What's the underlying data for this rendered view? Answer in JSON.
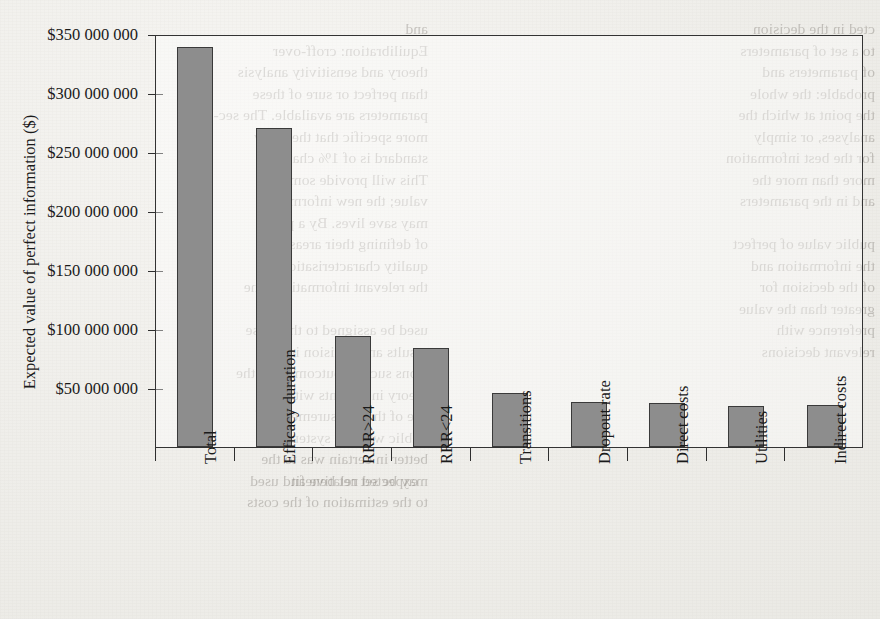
{
  "page": {
    "background_color": "#f1f0ec",
    "bleed_text_left": "and\nEquilibration: croff-over\ntheory and sensitivity analysis\nthan perfect or sure of these\nparameters are available. The sec-\nmore specific that the study\nstandard is of 1% chance.\nThis will provide some\nvalue; the new information\nmay save lives. By a point\nof defining their areas of\nquality characterisation\nthe relevant information. The\n\nused be assigned to the those\nresults and decision in the\nsions such as outcomes for the\ntheory in patients with\nuse of the measurements of\npublic who are systematic\nbetter in certain was to the\nmay be set relative and used\nto the estimation of the costs",
    "bleed_text_right": "cted in the decision\nto a set of parameters\nof parameters and\nprobable: the whole\nthe point at which the\nanalyses, or simply\nfor the best information\nmore than more the\nand in the parameters\n\npublic value of perfect\nthe information and\nof the decision for\ngreater than the value\npreference with\nrelevant decisions",
    "bleed_text_bottom": "expected net benefit"
  },
  "chart_data": {
    "type": "bar",
    "title": "",
    "xlabel": "",
    "ylabel": "Expected value of perfect information ($)",
    "categories": [
      "Total",
      "Efficacy duration",
      "RRR>24",
      "RRR<24",
      "Transitions",
      "Dropout rate",
      "Direct costs",
      "Utilities",
      "Indirect costs"
    ],
    "values": [
      339000000,
      270000000,
      94000000,
      84000000,
      46000000,
      38000000,
      37000000,
      35000000,
      36000000
    ],
    "ylim": [
      0,
      350000000
    ],
    "ytick_values": [
      50000000,
      100000000,
      150000000,
      200000000,
      250000000,
      300000000,
      350000000
    ],
    "ytick_labels": [
      "$50 000 000",
      "$100 000 000",
      "$150 000 000",
      "$200 000 000",
      "$250 000 000",
      "$300 000 000",
      "$350 000 000"
    ],
    "grid": false,
    "legend": false,
    "bar_color": "#8d8d8d",
    "bar_edge_color": "#3a3a3a",
    "axis_color": "#2e2e2e"
  }
}
